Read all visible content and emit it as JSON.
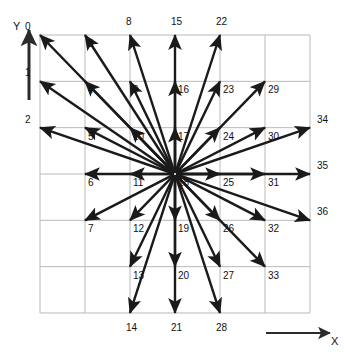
{
  "figure": {
    "type": "vector-direction-grid",
    "axes": {
      "x_label": "X",
      "y_label": "Y"
    },
    "grid": {
      "columns": 6,
      "rows": 6,
      "intersections_x": 7,
      "intersections_y": 7,
      "line_color": "#b9b9b9",
      "background": "#ffffff"
    },
    "arrow": {
      "color": "#1a1a1a",
      "center_index": 17,
      "count": 36
    }
  },
  "chart_data": {
    "type": "scatter",
    "title": "",
    "xlabel": "X",
    "ylabel": "Y",
    "center": {
      "col": 3,
      "row": 3,
      "index": 17
    },
    "note": "Indices run column-major: index = col*7 + row, col 0..6 left-to-right, row 0..6 top-to-bottom.",
    "points": [
      {
        "label": "0",
        "col": 0,
        "row": 0,
        "arrow": true
      },
      {
        "label": "1",
        "col": 0,
        "row": 1,
        "arrow": true
      },
      {
        "label": "2",
        "col": 0,
        "row": 2,
        "arrow": true
      },
      {
        "label": "3",
        "col": 1,
        "row": 0,
        "arrow": true
      },
      {
        "label": "4",
        "col": 1,
        "row": 1,
        "arrow": true
      },
      {
        "label": "5",
        "col": 1,
        "row": 2,
        "arrow": true
      },
      {
        "label": "6",
        "col": 1,
        "row": 3,
        "arrow": true
      },
      {
        "label": "7",
        "col": 1,
        "row": 4,
        "arrow": true
      },
      {
        "label": "8",
        "col": 2,
        "row": 0,
        "arrow": true
      },
      {
        "label": "9",
        "col": 2,
        "row": 1,
        "arrow": true
      },
      {
        "label": "10",
        "col": 2,
        "row": 2,
        "arrow": true
      },
      {
        "label": "11",
        "col": 2,
        "row": 3,
        "arrow": true
      },
      {
        "label": "12",
        "col": 2,
        "row": 4,
        "arrow": true
      },
      {
        "label": "13",
        "col": 2,
        "row": 5,
        "arrow": true
      },
      {
        "label": "14",
        "col": 2,
        "row": 6,
        "arrow": true
      },
      {
        "label": "15",
        "col": 3,
        "row": 0,
        "arrow": true
      },
      {
        "label": "16",
        "col": 3,
        "row": 1,
        "arrow": true
      },
      {
        "label": "17",
        "col": 3,
        "row": 2,
        "arrow": true
      },
      {
        "label": "18",
        "col": 3,
        "row": 3,
        "arrow": false
      },
      {
        "label": "19",
        "col": 3,
        "row": 4,
        "arrow": true
      },
      {
        "label": "20",
        "col": 3,
        "row": 5,
        "arrow": true
      },
      {
        "label": "21",
        "col": 3,
        "row": 6,
        "arrow": true
      },
      {
        "label": "22",
        "col": 4,
        "row": 0,
        "arrow": true
      },
      {
        "label": "23",
        "col": 4,
        "row": 1,
        "arrow": true
      },
      {
        "label": "24",
        "col": 4,
        "row": 2,
        "arrow": true
      },
      {
        "label": "25",
        "col": 4,
        "row": 3,
        "arrow": true
      },
      {
        "label": "26",
        "col": 4,
        "row": 4,
        "arrow": true
      },
      {
        "label": "27",
        "col": 4,
        "row": 5,
        "arrow": true
      },
      {
        "label": "28",
        "col": 4,
        "row": 6,
        "arrow": true
      },
      {
        "label": "29",
        "col": 5,
        "row": 1,
        "arrow": true
      },
      {
        "label": "30",
        "col": 5,
        "row": 2,
        "arrow": true
      },
      {
        "label": "31",
        "col": 5,
        "row": 3,
        "arrow": true
      },
      {
        "label": "32",
        "col": 5,
        "row": 4,
        "arrow": true
      },
      {
        "label": "33",
        "col": 5,
        "row": 5,
        "arrow": true
      },
      {
        "label": "34",
        "col": 6,
        "row": 2,
        "arrow": true
      },
      {
        "label": "35",
        "col": 6,
        "row": 3,
        "arrow": true
      },
      {
        "label": "36",
        "col": 6,
        "row": 4,
        "arrow": true
      }
    ],
    "labels_outside_grid": [
      "0",
      "1",
      "2",
      "8",
      "15",
      "22",
      "14",
      "21",
      "28",
      "34",
      "35",
      "36"
    ]
  }
}
